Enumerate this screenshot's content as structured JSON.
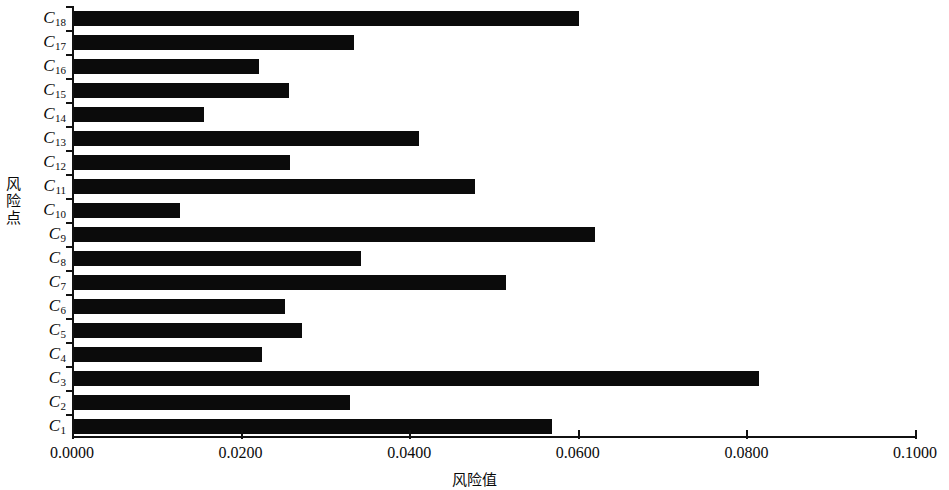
{
  "chart_data": {
    "type": "bar",
    "orientation": "horizontal",
    "title": "",
    "xlabel": "风险值",
    "ylabel": "风险点",
    "xlim": [
      0.0,
      0.1
    ],
    "xticks": [
      "0.0000",
      "0.0200",
      "0.0400",
      "0.0600",
      "0.0800",
      "0.1000"
    ],
    "xtick_values": [
      0.0,
      0.02,
      0.04,
      0.06,
      0.08,
      0.1
    ],
    "grid": false,
    "legend": null,
    "bar_color": "#0b0b0b",
    "categories": [
      "C1",
      "C2",
      "C3",
      "C4",
      "C5",
      "C6",
      "C7",
      "C8",
      "C9",
      "C10",
      "C11",
      "C12",
      "C13",
      "C14",
      "C15",
      "C16",
      "C17",
      "C18"
    ],
    "category_labels": [
      {
        "base": "C",
        "sub": "1"
      },
      {
        "base": "C",
        "sub": "2"
      },
      {
        "base": "C",
        "sub": "3"
      },
      {
        "base": "C",
        "sub": "4"
      },
      {
        "base": "C",
        "sub": "5"
      },
      {
        "base": "C",
        "sub": "6"
      },
      {
        "base": "C",
        "sub": "7"
      },
      {
        "base": "C",
        "sub": "8"
      },
      {
        "base": "C",
        "sub": "9"
      },
      {
        "base": "C",
        "sub": "10"
      },
      {
        "base": "C",
        "sub": "11"
      },
      {
        "base": "C",
        "sub": "12"
      },
      {
        "base": "C",
        "sub": "13"
      },
      {
        "base": "C",
        "sub": "14"
      },
      {
        "base": "C",
        "sub": "15"
      },
      {
        "base": "C",
        "sub": "16"
      },
      {
        "base": "C",
        "sub": "17"
      },
      {
        "base": "C",
        "sub": "18"
      }
    ],
    "values": [
      0.0567,
      0.0327,
      0.0813,
      0.0223,
      0.027,
      0.025,
      0.0513,
      0.034,
      0.0618,
      0.0126,
      0.0476,
      0.0256,
      0.0409,
      0.0154,
      0.0255,
      0.0219,
      0.0332,
      0.0599
    ]
  }
}
